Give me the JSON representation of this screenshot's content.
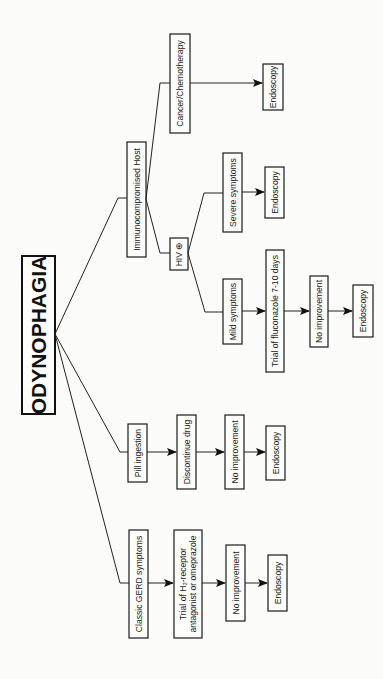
{
  "diagram": {
    "title": "ODYNOPHAGIA",
    "orientation": "rotated-90-ccw",
    "branches": {
      "gerd": {
        "steps": [
          "Classic GERD symptoms",
          "Trial of H₂-receptor",
          "antagonist or omeprazole",
          "No improvement",
          "Endoscopy"
        ]
      },
      "pill": {
        "steps": [
          "Pill ingestion",
          "Discontinue drug",
          "No improvement",
          "Endoscopy"
        ]
      },
      "immuno": {
        "label": "Immunocompromised Host",
        "hiv": {
          "label": "HIV ⊕",
          "mild": [
            "Mild symptoms",
            "Trial of fluconazole 7-10 days",
            "No improvement",
            "Endoscopy"
          ],
          "severe": [
            "Severe symptoms",
            "Endoscopy"
          ]
        },
        "cancer": [
          "Cancer/Chemotherapy",
          "Endoscopy"
        ]
      }
    }
  },
  "colors": {
    "background": "#fbfbf9",
    "stroke": "#1a1a1a"
  }
}
